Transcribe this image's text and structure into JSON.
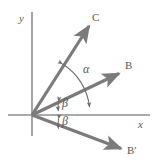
{
  "figure": {
    "background_color": "#ffffff",
    "stroke_color": "#7b7b7e",
    "axis_color": "#8e8e90",
    "text_color": "#58585a",
    "width": 154,
    "height": 166
  },
  "axes": {
    "x_label": "x",
    "y_label": "y",
    "origin": {
      "x": 32,
      "y": 115
    },
    "x_start": {
      "x": 8,
      "y": 115
    },
    "x_end": {
      "x": 150,
      "y": 115
    },
    "y_start": {
      "x": 32,
      "y": 12
    },
    "y_end": {
      "x": 32,
      "y": 136
    }
  },
  "vectors": [
    {
      "name": "C",
      "label": "C",
      "from": {
        "x": 32,
        "y": 115
      },
      "to": {
        "x": 91,
        "y": 23
      },
      "label_pos": {
        "x": 92,
        "y": 12
      }
    },
    {
      "name": "B",
      "label": "B",
      "from": {
        "x": 32,
        "y": 115
      },
      "to": {
        "x": 122,
        "y": 72
      },
      "label_pos": {
        "x": 125,
        "y": 60
      }
    },
    {
      "name": "B-prime",
      "label": "B′",
      "from": {
        "x": 32,
        "y": 115
      },
      "to": {
        "x": 124,
        "y": 150
      },
      "label_pos": {
        "x": 127,
        "y": 145
      }
    }
  ],
  "angles": [
    {
      "name": "alpha",
      "label": "α",
      "description": "double-headed arc from vector C down to the x-axis",
      "label_pos": {
        "x": 83,
        "y": 63
      }
    },
    {
      "name": "beta-upper",
      "label": "β",
      "description": "angle between vector B and the positive x-axis",
      "label_pos": {
        "x": 62,
        "y": 97
      }
    },
    {
      "name": "beta-lower",
      "label": "β",
      "description": "angle between the positive x-axis and vector B-prime",
      "label_pos": {
        "x": 62,
        "y": 115
      }
    }
  ]
}
